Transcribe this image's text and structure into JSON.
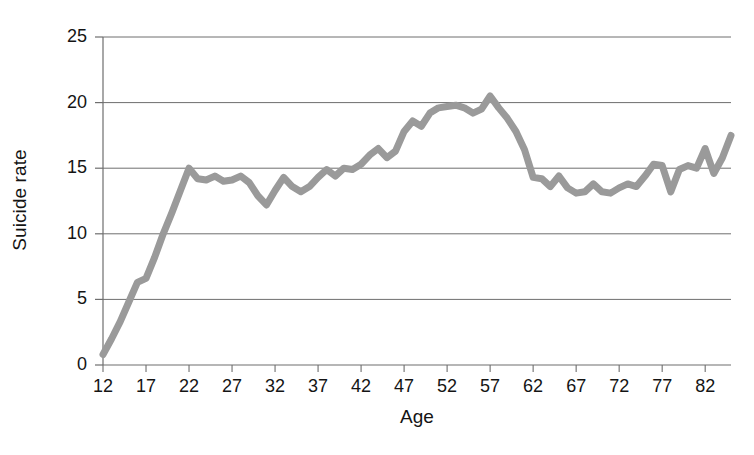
{
  "chart_data": {
    "type": "line",
    "title": "",
    "xlabel": "Age",
    "ylabel": "Suicide rate",
    "xlim": [
      12,
      85
    ],
    "ylim": [
      0,
      25
    ],
    "grid": true,
    "legend": null,
    "line_color": "#9a9a9a",
    "axis_color": "#6e6e6e",
    "background": "#ffffff",
    "xticks": [
      12,
      17,
      22,
      27,
      32,
      37,
      42,
      47,
      52,
      57,
      62,
      67,
      72,
      77,
      82
    ],
    "xtick_labels": [
      "12",
      "17",
      "22",
      "27",
      "32",
      "37",
      "42",
      "47",
      "52",
      "57",
      "62",
      "67",
      "72",
      "77",
      "82"
    ],
    "yticks": [
      0,
      5,
      10,
      15,
      20,
      25
    ],
    "ytick_labels": [
      "0",
      "5",
      "10",
      "15",
      "20",
      "25"
    ],
    "series": [
      {
        "name": "Suicide rate",
        "x": [
          12,
          13,
          14,
          15,
          16,
          17,
          18,
          19,
          20,
          21,
          22,
          23,
          24,
          25,
          26,
          27,
          28,
          29,
          30,
          31,
          32,
          33,
          34,
          35,
          36,
          37,
          38,
          39,
          40,
          41,
          42,
          43,
          44,
          45,
          46,
          47,
          48,
          49,
          50,
          51,
          52,
          53,
          54,
          55,
          56,
          57,
          58,
          59,
          60,
          61,
          62,
          63,
          64,
          65,
          66,
          67,
          68,
          69,
          70,
          71,
          72,
          73,
          74,
          75,
          76,
          77,
          78,
          79,
          80,
          81,
          82,
          83,
          84,
          85
        ],
        "values": [
          0.8,
          2.0,
          3.3,
          4.8,
          6.3,
          6.6,
          8.2,
          10.0,
          11.6,
          13.3,
          15.0,
          14.2,
          14.1,
          14.4,
          14.0,
          14.1,
          14.4,
          13.9,
          12.9,
          12.2,
          13.3,
          14.3,
          13.6,
          13.2,
          13.6,
          14.3,
          14.9,
          14.4,
          15.0,
          14.9,
          15.3,
          16.0,
          16.5,
          15.8,
          16.3,
          17.8,
          18.6,
          18.2,
          19.2,
          19.6,
          19.7,
          19.8,
          19.6,
          19.2,
          19.5,
          20.5,
          19.6,
          18.8,
          17.8,
          16.4,
          14.3,
          14.2,
          13.6,
          14.4,
          13.5,
          13.1,
          13.2,
          13.8,
          13.2,
          13.1,
          13.5,
          13.8,
          13.6,
          14.4,
          15.3,
          15.2,
          13.2,
          14.9,
          15.2,
          15.0,
          16.5,
          14.6,
          15.8,
          17.5
        ]
      }
    ]
  },
  "axes": {
    "plot_left_px": 103,
    "plot_right_px": 731,
    "plot_top_px": 37,
    "plot_bottom_px": 365
  }
}
